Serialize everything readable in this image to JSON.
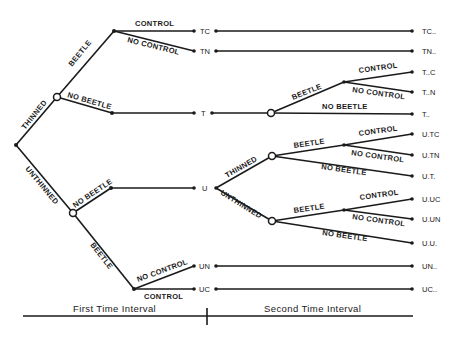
{
  "diagram": {
    "type": "decision-tree",
    "branch_labels": {
      "thinned": "THINNED",
      "unthinned": "UNTHINNED",
      "beetle": "BEETLE",
      "no_beetle": "NO BEETLE",
      "control": "CONTROL",
      "no_control": "NO CONTROL"
    },
    "first_interval_nodes": {
      "tc": "TC",
      "tn": "TN",
      "t": "T",
      "u": "U",
      "un": "UN",
      "uc": "UC"
    },
    "outcomes": {
      "tc": "TC..",
      "tn": "TN..",
      "t_c": "T..C",
      "t_n": "T..N",
      "t": "T..",
      "u_tc": "U.TC",
      "u_tn": "U.TN",
      "u_t": "U.T.",
      "u_uc": "U.UC",
      "u_un": "U.UN",
      "u_u": "U.U.",
      "un": "UN..",
      "uc": "UC.."
    },
    "timeline": {
      "first": "First  Time  Interval",
      "second": "Second  Time  Interval"
    }
  }
}
